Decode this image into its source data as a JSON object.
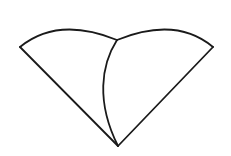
{
  "figure": {
    "name": "two-overlapping-circular-sectors",
    "background_color": "#ffffff",
    "stroke_color": "#1a1a1a",
    "stroke_width": 1.8,
    "canvas": {
      "width": 231,
      "height": 156
    },
    "vertices": {
      "left_apex": {
        "x": 20,
        "y": 47
      },
      "right_apex": {
        "x": 213,
        "y": 47
      },
      "bottom_apex": {
        "x": 118,
        "y": 146
      },
      "top_junction": {
        "x": 117,
        "y": 40
      }
    },
    "paths": {
      "left_sector_arc": "M 20 47 Q 58 16 117 40",
      "left_sector_radius": "M 20 47 L 118 146",
      "right_sector_arc": "M 117 40 Q 176 16 213 47",
      "right_sector_radius": "M 213 47 L 118 146",
      "inner_overlap_arc": "M 117 40 C 101 65 96 102 118 146"
    },
    "path_labels": {
      "left_sector_arc": "left-sector-arc",
      "left_sector_radius": "left-sector-radius",
      "right_sector_arc": "right-sector-arc",
      "right_sector_radius": "right-sector-radius",
      "inner_overlap_arc": "inner-overlap-arc"
    }
  }
}
